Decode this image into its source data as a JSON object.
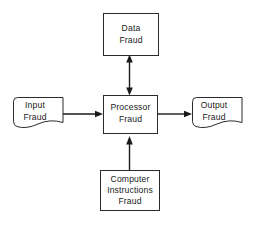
{
  "diagram": {
    "background_color": "#ffffff",
    "line_color": "#1a1a1a",
    "shape_fill": "#ffffff",
    "shape_stroke": "#2b2b2b",
    "nodes": [
      {
        "id": "data-fraud",
        "shape": "rectangle",
        "label_lines": [
          "Data",
          "Fraud"
        ],
        "line1": "Data",
        "line2": "Fraud",
        "x": 103,
        "y": 13,
        "w": 55,
        "h": 42
      },
      {
        "id": "input-fraud",
        "shape": "document",
        "label_lines": [
          "Input",
          "Fraud"
        ],
        "line1": "Input",
        "line2": "Fraud",
        "x": 13,
        "y": 97,
        "w": 50,
        "h": 31
      },
      {
        "id": "processor-fraud",
        "shape": "rectangle",
        "label_lines": [
          "Processor",
          "Fraud"
        ],
        "line1": "Processor",
        "line2": "Fraud",
        "x": 103,
        "y": 95,
        "w": 54,
        "h": 38
      },
      {
        "id": "output-fraud",
        "shape": "document",
        "label_lines": [
          "Output",
          "Fraud"
        ],
        "line1": "Output",
        "line2": "Fraud",
        "x": 192,
        "y": 97,
        "w": 50,
        "h": 31
      },
      {
        "id": "computer-instructions-fraud",
        "shape": "rectangle",
        "label_lines": [
          "Computer",
          "Instructions",
          "Fraud"
        ],
        "line1": "Computer",
        "line2": "Instructions",
        "line3": "Fraud",
        "x": 100,
        "y": 170,
        "w": 60,
        "h": 40
      }
    ],
    "edges": [
      {
        "id": "edge-processor-data",
        "from": "processor-fraud",
        "to": "data-fraud",
        "direction": "bidirectional",
        "orientation": "vertical"
      },
      {
        "id": "edge-input-processor",
        "from": "input-fraud",
        "to": "processor-fraud",
        "direction": "unidirectional",
        "orientation": "horizontal"
      },
      {
        "id": "edge-processor-output",
        "from": "processor-fraud",
        "to": "output-fraud",
        "direction": "unidirectional",
        "orientation": "horizontal"
      },
      {
        "id": "edge-instructions-processor",
        "from": "computer-instructions-fraud",
        "to": "processor-fraud",
        "direction": "unidirectional",
        "orientation": "vertical"
      }
    ]
  }
}
